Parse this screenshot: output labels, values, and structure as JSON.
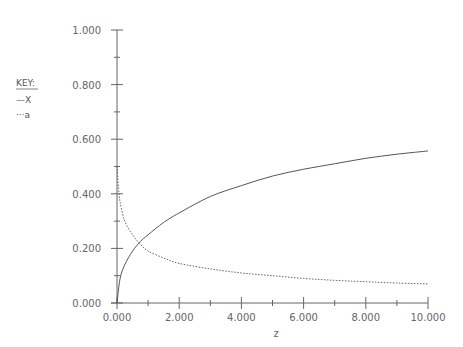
{
  "chart_data": {
    "type": "line",
    "title": "",
    "xlabel": "z",
    "ylabel": "",
    "xlim": [
      0,
      10
    ],
    "ylim": [
      0,
      1
    ],
    "grid": false,
    "legend_position": "left",
    "x_ticks": [
      "0.000",
      "2.000",
      "4.000",
      "6.000",
      "8.000",
      "10.000"
    ],
    "y_ticks": [
      "0.000",
      "0.200",
      "0.400",
      "0.600",
      "0.800",
      "1.000"
    ],
    "legend": {
      "title": "KEY:",
      "entries": [
        {
          "symbol": "—",
          "label": "X",
          "style": "solid"
        },
        {
          "symbol": "···",
          "label": "a",
          "style": "dotted"
        }
      ]
    },
    "series": [
      {
        "name": "X",
        "style": "solid",
        "x": [
          0,
          0.1,
          0.25,
          0.5,
          0.75,
          1,
          1.5,
          2,
          3,
          4,
          5,
          6,
          7,
          8,
          9,
          10
        ],
        "y": [
          0.0,
          0.09,
          0.14,
          0.19,
          0.225,
          0.25,
          0.295,
          0.33,
          0.39,
          0.43,
          0.465,
          0.49,
          0.51,
          0.53,
          0.545,
          0.557
        ]
      },
      {
        "name": "a",
        "style": "dotted",
        "x": [
          0,
          0.05,
          0.1,
          0.25,
          0.5,
          0.75,
          1,
          1.5,
          2,
          3,
          4,
          5,
          6,
          7,
          8,
          9,
          10
        ],
        "y": [
          0.5,
          0.42,
          0.37,
          0.3,
          0.25,
          0.215,
          0.19,
          0.165,
          0.145,
          0.125,
          0.11,
          0.1,
          0.09,
          0.083,
          0.078,
          0.073,
          0.07
        ]
      }
    ]
  },
  "key": {
    "title": "KEY:",
    "items": [
      {
        "symbol": "—",
        "label": "X"
      },
      {
        "symbol": "···",
        "label": "a"
      }
    ]
  }
}
